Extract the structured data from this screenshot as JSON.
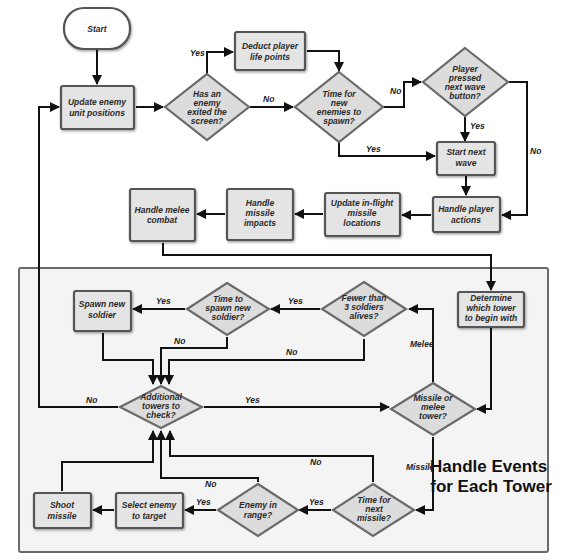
{
  "diagram": {
    "region_title": [
      "Handle Events",
      "for Each Tower"
    ],
    "nodes": {
      "start": {
        "lines": [
          "Start"
        ]
      },
      "update_enemy": {
        "lines": [
          "Update enemy",
          "unit positions"
        ]
      },
      "enemy_exited": {
        "lines": [
          "Has an",
          "enemy",
          "exited the",
          "screen?"
        ]
      },
      "deduct_life": {
        "lines": [
          "Deduct player",
          "life points"
        ]
      },
      "time_new_enemies": {
        "lines": [
          "Time for",
          "new",
          "enemies to",
          "spawn?"
        ]
      },
      "next_wave_pressed": {
        "lines": [
          "Player",
          "pressed",
          "next wave",
          "button?"
        ]
      },
      "start_next_wave": {
        "lines": [
          "Start next",
          "wave"
        ]
      },
      "handle_player_actions": {
        "lines": [
          "Handle player",
          "actions"
        ]
      },
      "update_missiles": {
        "lines": [
          "Update in-flight",
          "missile",
          "locations"
        ]
      },
      "handle_missile_impacts": {
        "lines": [
          "Handle",
          "missile",
          "impacts"
        ]
      },
      "handle_melee": {
        "lines": [
          "Handle melee",
          "combat"
        ]
      },
      "determine_tower": {
        "lines": [
          "Determine",
          "which tower",
          "to begin with"
        ]
      },
      "fewer_soldiers": {
        "lines": [
          "Fewer than",
          "3 soldiers",
          "alives?"
        ]
      },
      "time_spawn_soldier": {
        "lines": [
          "Time to",
          "spawn new",
          "soldier?"
        ]
      },
      "spawn_soldier": {
        "lines": [
          "Spawn new",
          "soldier"
        ]
      },
      "additional_towers": {
        "lines": [
          "Additional",
          "towers to",
          "check?"
        ]
      },
      "missile_or_melee": {
        "lines": [
          "Missile or",
          "melee",
          "tower?"
        ]
      },
      "time_next_missile": {
        "lines": [
          "Time for",
          "next",
          "missile?"
        ]
      },
      "enemy_in_range": {
        "lines": [
          "Enemy in",
          "range?"
        ]
      },
      "select_enemy": {
        "lines": [
          "Select enemy",
          "to target"
        ]
      },
      "shoot_missile": {
        "lines": [
          "Shoot",
          "missile"
        ]
      }
    },
    "edge_labels": {
      "exited_yes": "Yes",
      "exited_no": "No",
      "spawn_no": "No",
      "spawn_yes": "Yes",
      "wave_yes": "Yes",
      "wave_no": "No",
      "fewer_yes": "Yes",
      "fewer_no": "No",
      "time_soldier_yes": "Yes",
      "time_soldier_no": "No",
      "additional_no": "No",
      "additional_yes": "Yes",
      "melee": "Melee",
      "missile": "Missile",
      "next_missile_no": "No",
      "next_missile_yes": "Yes",
      "in_range_no": "No",
      "in_range_yes": "Yes"
    }
  }
}
